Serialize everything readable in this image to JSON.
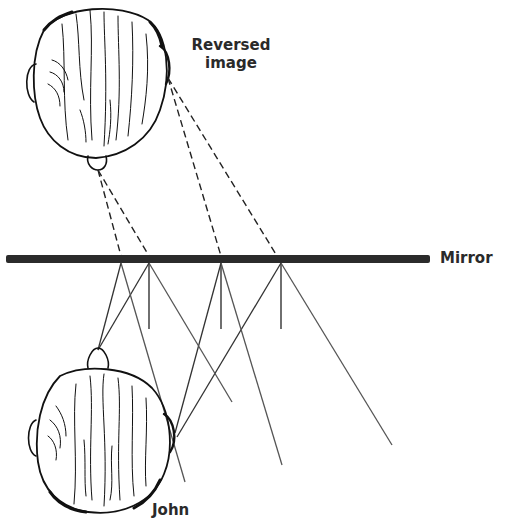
{
  "diagram": {
    "labels": {
      "reversed_line1": "Reversed",
      "reversed_line2": "image",
      "mirror": "Mirror",
      "john": "John"
    },
    "colors": {
      "background": "#ffffff",
      "mirror": "#2b2b2b",
      "ink": "#111111",
      "rays": "#444444",
      "text": "#2a2a2a"
    },
    "mirror": {
      "x1": 6,
      "x2": 430,
      "y": 259,
      "thickness": 8
    },
    "reflection_points": [
      {
        "x": 121,
        "y": 263
      },
      {
        "x": 149,
        "y": 263
      },
      {
        "x": 221,
        "y": 263
      },
      {
        "x": 281,
        "y": 263
      }
    ],
    "virtual_rays": [
      {
        "from": [
          98,
          170
        ],
        "to": [
          121,
          256
        ]
      },
      {
        "from": [
          98,
          170
        ],
        "to": [
          149,
          256
        ]
      },
      {
        "from": [
          168,
          78
        ],
        "to": [
          221,
          256
        ]
      },
      {
        "from": [
          168,
          78
        ],
        "to": [
          277,
          256
        ]
      }
    ],
    "incident_rays": [
      {
        "from": [
          98,
          350
        ],
        "to": [
          121,
          263
        ]
      },
      {
        "from": [
          98,
          350
        ],
        "to": [
          149,
          263
        ]
      },
      {
        "from": [
          175,
          433
        ],
        "to": [
          221,
          263
        ]
      },
      {
        "from": [
          177,
          437
        ],
        "to": [
          281,
          263
        ]
      }
    ],
    "reflected_rays": [
      {
        "from": [
          121,
          263
        ],
        "to": [
          185,
          482
        ]
      },
      {
        "from": [
          149,
          263
        ],
        "to": [
          232,
          402
        ]
      },
      {
        "from": [
          221,
          263
        ],
        "to": [
          282,
          465
        ]
      },
      {
        "from": [
          281,
          263
        ],
        "to": [
          392,
          445
        ]
      }
    ],
    "normals": [
      {
        "x": 149,
        "y1": 263,
        "y2": 329
      },
      {
        "x": 221,
        "y1": 263,
        "y2": 329
      },
      {
        "x": 281,
        "y1": 263,
        "y2": 329
      }
    ]
  }
}
